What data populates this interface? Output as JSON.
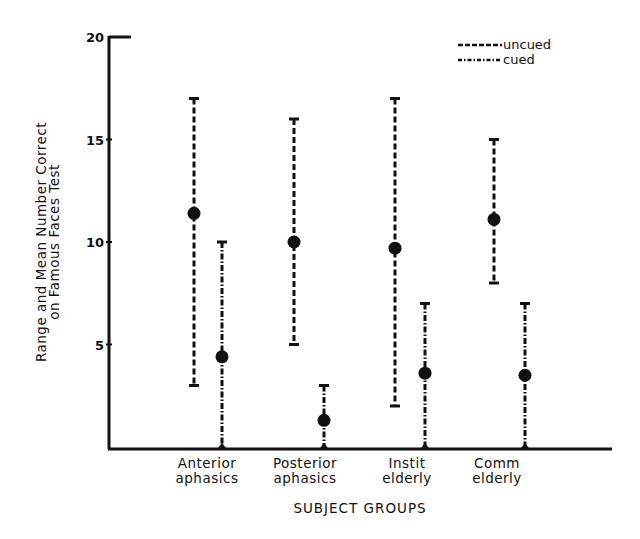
{
  "chart_data": {
    "type": "range-and-mean (error bar)",
    "title": "",
    "xlabel": "SUBJECT GROUPS",
    "ylabel": [
      "Range and Mean Number Correct",
      "on Famous Faces Test"
    ],
    "ylim": [
      0,
      20
    ],
    "yticks": [
      5,
      10,
      15,
      20
    ],
    "grid": false,
    "legend_position": "top-right",
    "categories": [
      [
        "Anterior",
        "aphasics"
      ],
      [
        "Posterior",
        "aphasics"
      ],
      [
        "Instit",
        "elderly"
      ],
      [
        "Comm",
        "elderly"
      ]
    ],
    "series": [
      {
        "name": "uncued",
        "line_style": "dashed",
        "means": [
          11.4,
          10.0,
          9.7,
          11.1
        ],
        "min": [
          3,
          5,
          2,
          8
        ],
        "max": [
          17,
          16,
          17,
          15
        ]
      },
      {
        "name": "cued",
        "line_style": "dash-dot",
        "means": [
          4.4,
          1.3,
          3.6,
          3.5
        ],
        "min": [
          0,
          0,
          0,
          0
        ],
        "max": [
          10,
          3,
          7,
          7
        ]
      }
    ]
  },
  "colors": {
    "ink": "#111111",
    "background": "#ffffff"
  }
}
